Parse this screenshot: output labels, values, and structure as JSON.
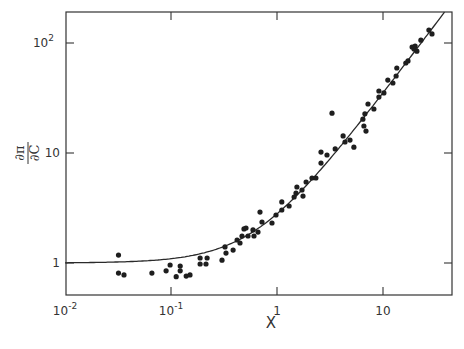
{
  "chart_data": {
    "type": "scatter",
    "title": "",
    "xlabel": "X",
    "ylabel": "∂π/∂C",
    "xscale": "log",
    "yscale": "log",
    "xlim": [
      0.01,
      45
    ],
    "ylim": [
      0.7,
      200
    ],
    "grid": false,
    "legend": null,
    "x_ticks": [
      {
        "value": 0.01,
        "label": "10",
        "sup": "-2"
      },
      {
        "value": 0.1,
        "label": "10",
        "sup": "-1"
      },
      {
        "value": 1,
        "label": "1",
        "sup": ""
      },
      {
        "value": 10,
        "label": "10",
        "sup": ""
      }
    ],
    "y_ticks": [
      {
        "value": 1,
        "label": "1",
        "sup": ""
      },
      {
        "value": 10,
        "label": "10",
        "sup": ""
      },
      {
        "value": 100,
        "label": "10",
        "sup": "2"
      }
    ],
    "series": [
      {
        "name": "data points",
        "kind": "scatter",
        "points": [
          [
            0.032,
            1.18
          ],
          [
            0.032,
            0.81
          ],
          [
            0.036,
            0.78
          ],
          [
            0.066,
            0.81
          ],
          [
            0.09,
            0.85
          ],
          [
            0.098,
            0.96
          ],
          [
            0.112,
            0.75
          ],
          [
            0.122,
            0.94
          ],
          [
            0.122,
            0.85
          ],
          [
            0.139,
            0.76
          ],
          [
            0.151,
            0.78
          ],
          [
            0.188,
            1.11
          ],
          [
            0.188,
            0.98
          ],
          [
            0.219,
            1.11
          ],
          [
            0.214,
            0.98
          ],
          [
            0.303,
            1.06
          ],
          [
            0.323,
            1.4
          ],
          [
            0.33,
            1.23
          ],
          [
            0.385,
            1.31
          ],
          [
            0.42,
            1.62
          ],
          [
            0.448,
            1.52
          ],
          [
            0.468,
            1.76
          ],
          [
            0.488,
            2.04
          ],
          [
            0.51,
            2.08
          ],
          [
            0.533,
            1.76
          ],
          [
            0.594,
            2.0
          ],
          [
            0.607,
            1.76
          ],
          [
            0.662,
            1.91
          ],
          [
            0.691,
            2.9
          ],
          [
            0.722,
            2.36
          ],
          [
            0.897,
            2.31
          ],
          [
            0.978,
            2.73
          ],
          [
            1.11,
            3.59
          ],
          [
            1.11,
            3.03
          ],
          [
            1.3,
            3.3
          ],
          [
            1.45,
            3.98
          ],
          [
            1.51,
            4.33
          ],
          [
            1.54,
            4.91
          ],
          [
            1.72,
            4.61
          ],
          [
            1.76,
            4.06
          ],
          [
            1.88,
            5.45
          ],
          [
            2.14,
            5.92
          ],
          [
            2.33,
            5.92
          ],
          [
            2.6,
            8.1
          ],
          [
            2.6,
            10.2
          ],
          [
            2.96,
            9.6
          ],
          [
            3.3,
            23.0
          ],
          [
            3.54,
            10.9
          ],
          [
            4.2,
            14.3
          ],
          [
            4.38,
            12.6
          ],
          [
            4.88,
            13.1
          ],
          [
            5.32,
            11.3
          ],
          [
            6.46,
            20.3
          ],
          [
            6.75,
            22.7
          ],
          [
            6.61,
            17.6
          ],
          [
            6.91,
            15.8
          ],
          [
            7.22,
            27.9
          ],
          [
            8.21,
            25.1
          ],
          [
            9.15,
            36.6
          ],
          [
            9.15,
            32.2
          ],
          [
            10.2,
            35.2
          ],
          [
            11.1,
            46.0
          ],
          [
            12.4,
            43.3
          ],
          [
            13.3,
            50.1
          ],
          [
            13.5,
            59.3
          ],
          [
            16.4,
            65.8
          ],
          [
            17.2,
            68.7
          ],
          [
            18.8,
            91.9
          ],
          [
            19.6,
            88.0
          ],
          [
            20.1,
            93.9
          ],
          [
            20.9,
            84.3
          ],
          [
            22.8,
            106
          ],
          [
            27.1,
            131
          ],
          [
            29.0,
            121
          ]
        ]
      },
      {
        "name": "fit curve",
        "kind": "line",
        "formula": "y = 1 + 1.8 * x^1.28",
        "a": 1.8,
        "n": 1.28
      }
    ]
  }
}
